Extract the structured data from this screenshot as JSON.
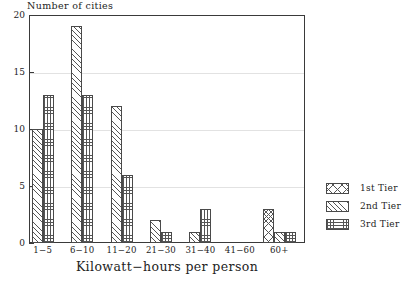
{
  "chart_data": {
    "type": "bar",
    "title": "",
    "xlabel": "Kilowatt−hours per person",
    "ylabel": "Number of cities",
    "categories": [
      "1−5",
      "6−10",
      "11−20",
      "21−30",
      "31−40",
      "41−60",
      "60+"
    ],
    "series": [
      {
        "name": "1st Tier",
        "pattern": "crosshatch",
        "values": [
          0,
          0,
          0,
          0,
          0,
          0,
          3
        ]
      },
      {
        "name": "2nd Tier",
        "pattern": "diagonal",
        "values": [
          10,
          19,
          12,
          2,
          1,
          0,
          1
        ]
      },
      {
        "name": "3rd Tier",
        "pattern": "grid",
        "values": [
          13,
          13,
          6,
          1,
          3,
          0,
          1
        ]
      }
    ],
    "ylim": [
      0,
      20
    ],
    "yticks": [
      0,
      5,
      10,
      15,
      20
    ],
    "ytick_labels": [
      "0",
      "5",
      "10",
      "15",
      "20"
    ],
    "grid": true,
    "legend_position": "right",
    "colors": {
      "axis": "#3a3a3a",
      "grid": "#e2e2e2",
      "hatch": "#555555",
      "background": "#ffffff",
      "text": "#232323"
    }
  },
  "legend": {
    "entries": [
      {
        "label": "1st Tier"
      },
      {
        "label": "2nd Tier"
      },
      {
        "label": "3rd Tier"
      }
    ]
  }
}
